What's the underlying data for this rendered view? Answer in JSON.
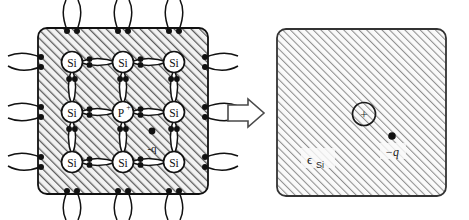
{
  "figure": {
    "type": "physics-diagram",
    "background_color": "#ffffff",
    "hatch_color": "#4a4a4a",
    "line_color": "#1a1a1a"
  },
  "left_panel": {
    "name": "silicon-lattice-panel",
    "box": {
      "x": 38,
      "y": 28,
      "width": 170,
      "height": 166,
      "corner_radius": 9,
      "fill": "hatched"
    },
    "lattice": {
      "rows": 3,
      "cols": 3,
      "atom_radius": 10.5,
      "atoms": [
        {
          "row": 0,
          "col": 0,
          "label": "Si",
          "cx": 72,
          "cy": 62
        },
        {
          "row": 0,
          "col": 1,
          "label": "Si",
          "cx": 123,
          "cy": 62
        },
        {
          "row": 0,
          "col": 2,
          "label": "Si",
          "cx": 174,
          "cy": 62
        },
        {
          "row": 1,
          "col": 0,
          "label": "Si",
          "cx": 72,
          "cy": 112
        },
        {
          "row": 1,
          "col": 1,
          "label": "P+",
          "cx": 123,
          "cy": 112
        },
        {
          "row": 1,
          "col": 2,
          "label": "Si",
          "cx": 174,
          "cy": 112
        },
        {
          "row": 2,
          "col": 0,
          "label": "Si",
          "cx": 72,
          "cy": 162
        },
        {
          "row": 2,
          "col": 1,
          "label": "Si",
          "cx": 123,
          "cy": 162
        },
        {
          "row": 2,
          "col": 2,
          "label": "Si",
          "cx": 174,
          "cy": 162
        }
      ],
      "bond_description": "lens-shaped covalent bond containing two electron dots",
      "electrons_per_bond": 2
    },
    "free_electron": {
      "name": "free-electron",
      "label": "-q",
      "dot_x": 152,
      "dot_y": 131,
      "label_x": 150,
      "label_y": 150
    }
  },
  "arrow": {
    "name": "transform-arrow",
    "direction": "right",
    "x": 228,
    "y": 100,
    "width": 36,
    "height": 26
  },
  "right_panel": {
    "name": "continuum-model-panel",
    "box": {
      "x": 277,
      "y": 29,
      "width": 169,
      "height": 167,
      "corner_radius": 9,
      "fill": "hatched"
    },
    "medium_label": {
      "name": "permittivity-label",
      "base": "ϵ",
      "subscript": "Si",
      "x": 308,
      "y": 162
    },
    "donor_ion": {
      "name": "donor-ion",
      "label": "+",
      "cx": 364,
      "cy": 114,
      "r": 11.5
    },
    "electron": {
      "name": "electron-charge",
      "label": "−q",
      "dot_x": 392,
      "dot_y": 136,
      "label_x": 386,
      "label_y": 155
    }
  }
}
